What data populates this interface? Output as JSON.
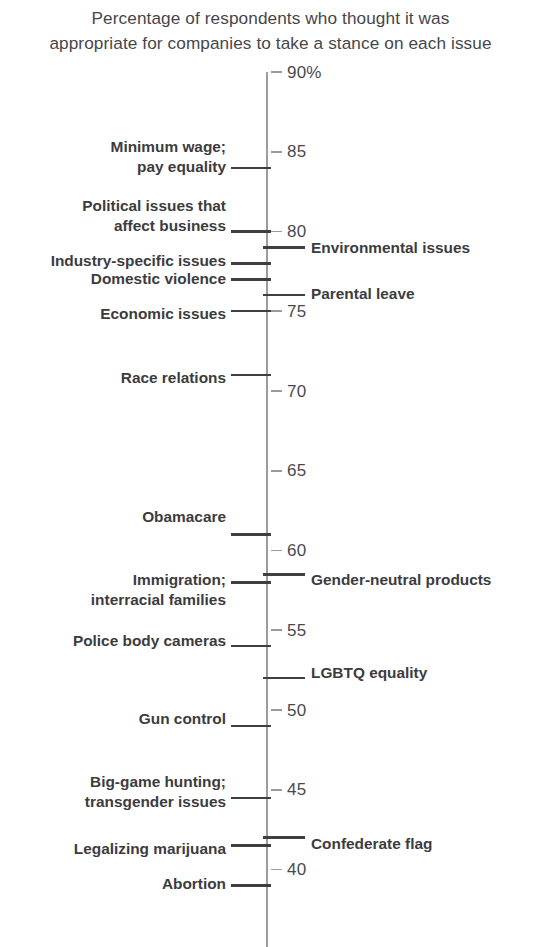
{
  "chart_data": {
    "type": "scatter",
    "title": "Percentage of respondents who thought it was\nappropriate for companies to take a stance on each issue",
    "xlabel": "",
    "ylabel": "",
    "ylim": [
      38,
      90
    ],
    "grid": false,
    "legend_position": "none",
    "orientation": "vertical-number-line",
    "axis_ticks": [
      {
        "label": "90%",
        "value": 90
      },
      {
        "label": "85",
        "value": 85
      },
      {
        "label": "80",
        "value": 80
      },
      {
        "label": "75",
        "value": 75
      },
      {
        "label": "70",
        "value": 70
      },
      {
        "label": "65",
        "value": 65
      },
      {
        "label": "60",
        "value": 60
      },
      {
        "label": "55",
        "value": 55
      },
      {
        "label": "50",
        "value": 50
      },
      {
        "label": "45",
        "value": 45
      },
      {
        "label": "40",
        "value": 40
      }
    ],
    "categories": [
      "Minimum wage; pay equality",
      "Political issues that affect business",
      "Environmental issues",
      "Industry-specific issues",
      "Domestic violence",
      "Parental leave",
      "Economic issues",
      "Race relations",
      "Obamacare",
      "Gender-neutral products",
      "Immigration; interracial families",
      "Police body cameras",
      "LGBTQ equality",
      "Gun control",
      "Big-game hunting; transgender issues",
      "Confederate flag",
      "Legalizing marijuana",
      "Abortion"
    ],
    "values": [
      84,
      80,
      79,
      78,
      77,
      76,
      75,
      71,
      61,
      58.5,
      58,
      54,
      52,
      49,
      44.5,
      42,
      41.5,
      39
    ],
    "points": [
      {
        "label": "Minimum wage;\npay equality",
        "value": 84,
        "side": "left",
        "label_y": 137
      },
      {
        "label": "Political issues that\naffect business",
        "value": 80,
        "side": "left",
        "label_y": 196
      },
      {
        "label": "Environmental issues",
        "value": 79,
        "side": "right",
        "label_y": 238
      },
      {
        "label": "Industry-specific issues",
        "value": 78,
        "side": "left",
        "label_y": 251
      },
      {
        "label": "Domestic violence",
        "value": 77,
        "side": "left",
        "label_y": 269
      },
      {
        "label": "Parental leave",
        "value": 76,
        "side": "right",
        "label_y": 284
      },
      {
        "label": "Economic issues",
        "value": 75,
        "side": "left",
        "label_y": 304
      },
      {
        "label": "Race relations",
        "value": 71,
        "side": "left",
        "label_y": 368
      },
      {
        "label": "Obamacare",
        "value": 61,
        "side": "left",
        "label_y": 507
      },
      {
        "label": "Gender-neutral products",
        "value": 58.5,
        "side": "right",
        "label_y": 570
      },
      {
        "label": "Immigration;\ninterracial families",
        "value": 58,
        "side": "left",
        "label_y": 570
      },
      {
        "label": "Police body cameras",
        "value": 54,
        "side": "left",
        "label_y": 631
      },
      {
        "label": "LGBTQ equality",
        "value": 52,
        "side": "right",
        "label_y": 663
      },
      {
        "label": "Gun control",
        "value": 49,
        "side": "left",
        "label_y": 709
      },
      {
        "label": "Big-game hunting;\ntransgender issues",
        "value": 44.5,
        "side": "left",
        "label_y": 772
      },
      {
        "label": "Confederate flag",
        "value": 42,
        "side": "right",
        "label_y": 834
      },
      {
        "label": "Legalizing marijuana",
        "value": 41.5,
        "side": "left",
        "label_y": 839
      },
      {
        "label": "Abortion",
        "value": 39,
        "side": "left",
        "label_y": 874
      }
    ],
    "colors": {
      "axis": "#9b9b9f",
      "connector": "#3f3f42",
      "label_text": "#3c3c40",
      "tick_text": "#4a4a4e",
      "title_text": "#46464a",
      "background": "#ffffff"
    }
  }
}
